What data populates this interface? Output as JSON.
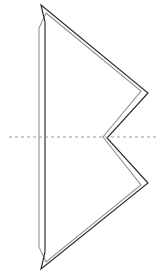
{
  "figure": {
    "background_color": "#ffffff",
    "width": 163,
    "height": 274,
    "outer_outline": {
      "name": "outer-dart-outline",
      "color": "#2b2b2b",
      "stroke_width": 1.15,
      "closed": true,
      "points": [
        [
          41,
          5
        ],
        [
          148,
          93
        ],
        [
          107,
          138
        ],
        [
          148,
          183
        ],
        [
          41,
          269
        ],
        [
          45,
          252
        ],
        [
          45,
          22
        ]
      ]
    },
    "inner_outline": {
      "name": "inner-dart-outline",
      "color": "#8d8d8d",
      "stroke_width": 1.05,
      "closed": true,
      "points": [
        [
          46,
          13
        ],
        [
          141,
          91
        ],
        [
          103,
          137
        ],
        [
          141,
          185
        ],
        [
          46,
          262
        ],
        [
          39,
          247
        ],
        [
          39,
          28
        ]
      ]
    },
    "centerline": {
      "name": "horizontal-centerline",
      "color": "#9a9a9a",
      "stroke_width": 1,
      "dash_pattern": "3 3",
      "y": 137,
      "x_start": 9,
      "x_end": 156
    }
  }
}
